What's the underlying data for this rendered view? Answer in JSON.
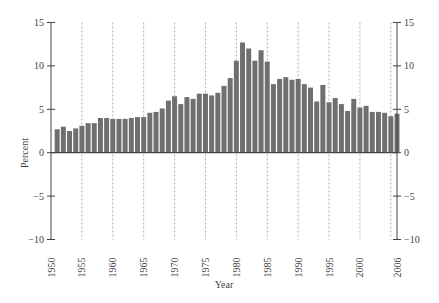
{
  "chart_data": {
    "type": "bar",
    "title": "",
    "xlabel": "Year",
    "ylabel": "Percent",
    "ylim": [
      -10,
      15
    ],
    "xlim": [
      1950,
      2006
    ],
    "yticks": [
      -10,
      -5,
      0,
      5,
      10,
      15
    ],
    "xticks": [
      1950,
      1955,
      1960,
      1965,
      1970,
      1975,
      1980,
      1985,
      1990,
      1995,
      2000,
      2006
    ],
    "vertical_dashed_gridlines_at": [
      1955,
      1960,
      1965,
      1970,
      1975,
      1980,
      1985,
      1990,
      1995,
      2000,
      2005
    ],
    "secondary_y_axis": true,
    "grid": "vertical dashed",
    "legend": null,
    "categories": [
      1951,
      1952,
      1953,
      1954,
      1955,
      1956,
      1957,
      1958,
      1959,
      1960,
      1961,
      1962,
      1963,
      1964,
      1965,
      1966,
      1967,
      1968,
      1969,
      1970,
      1971,
      1972,
      1973,
      1974,
      1975,
      1976,
      1977,
      1978,
      1979,
      1980,
      1981,
      1982,
      1983,
      1984,
      1985,
      1986,
      1987,
      1988,
      1989,
      1990,
      1991,
      1992,
      1993,
      1994,
      1995,
      1996,
      1997,
      1998,
      1999,
      2000,
      2001,
      2002,
      2003,
      2004,
      2005,
      2006
    ],
    "values": [
      2.7,
      3.0,
      2.5,
      2.8,
      3.1,
      3.4,
      3.4,
      4.0,
      4.0,
      3.9,
      3.9,
      3.9,
      4.0,
      4.1,
      4.1,
      4.6,
      4.7,
      5.1,
      6.0,
      6.5,
      5.6,
      6.4,
      6.2,
      6.8,
      6.8,
      6.6,
      6.9,
      7.7,
      8.6,
      10.6,
      12.7,
      12.0,
      10.6,
      11.8,
      10.5,
      7.9,
      8.5,
      8.7,
      8.4,
      8.5,
      7.9,
      7.5,
      5.9,
      7.8,
      5.8,
      6.3,
      5.6,
      4.8,
      6.2,
      5.2,
      5.4,
      4.7,
      4.7,
      4.6,
      4.2,
      4.5
    ]
  },
  "colors": {
    "bar": "#6f6f6f",
    "axis": "#444444",
    "gridline": "#9a9a9a",
    "background": "#ffffff"
  },
  "caption": "Exhibit  (caption text cut off)"
}
